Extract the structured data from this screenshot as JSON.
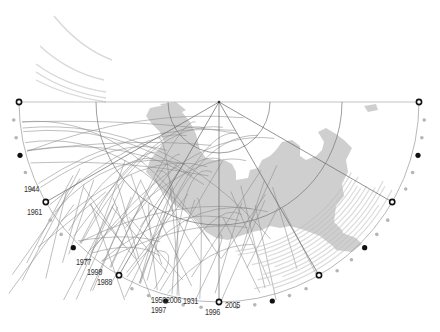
{
  "diagram": {
    "type": "polar-half-circle-map",
    "center": [
      219,
      102
    ],
    "radii": {
      "outer": 200,
      "middle": 123,
      "inner": 51
    },
    "colors": {
      "land": "#cfcfcf",
      "track": "#8a8a8a",
      "track_light": "#d4d4d4",
      "grid": "#777777",
      "marker_open_stroke": "#111111",
      "marker_filled": "#111111",
      "tick_dot": "#b5b5b5",
      "label": "#333333"
    },
    "radial_spokes_deg": [
      0,
      30,
      60,
      90,
      120,
      150,
      180
    ],
    "markers": {
      "open_circle_deg": [
        0,
        30,
        60,
        90,
        120,
        150,
        180
      ],
      "filled_dot_deg": [
        15,
        45,
        75,
        105,
        135,
        165
      ],
      "tick_step_deg": 5
    },
    "year_labels": [
      {
        "text": "1944",
        "x": 24,
        "y": 184
      },
      {
        "text": "1961",
        "x": 27,
        "y": 207
      },
      {
        "text": "1977",
        "x": 76,
        "y": 257
      },
      {
        "text": "1998",
        "x": 87,
        "y": 267
      },
      {
        "text": "1988",
        "x": 97,
        "y": 277
      },
      {
        "text": "1950",
        "x": 151,
        "y": 295
      },
      {
        "text": "1997",
        "x": 151,
        "y": 305
      },
      {
        "text": "2006",
        "x": 166,
        "y": 295
      },
      {
        "text": "1931",
        "x": 183,
        "y": 296
      },
      {
        "text": "1996",
        "x": 205,
        "y": 307
      },
      {
        "text": "2005",
        "x": 225,
        "y": 300
      }
    ]
  }
}
